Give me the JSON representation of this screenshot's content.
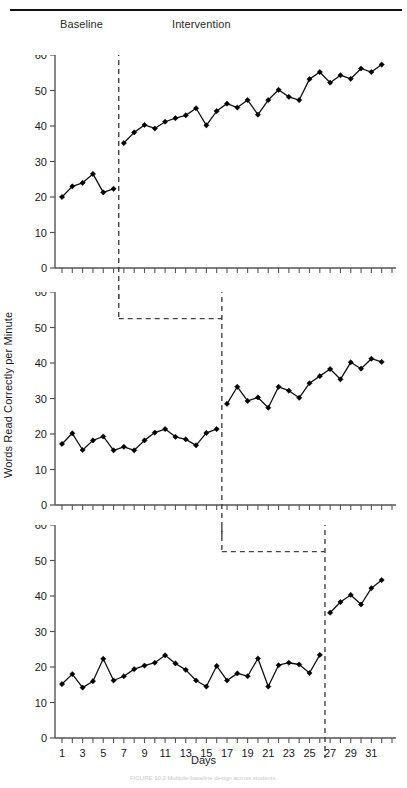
{
  "figure": {
    "top_rule": true,
    "x_axis_title": "Days",
    "y_axis_title": "Words Read Correctly per Minute",
    "caption": "FIGURE 10.2  Multiple-baseline design across students.",
    "phase_labels": {
      "baseline": "Baseline",
      "intervention": "Intervention"
    },
    "colors": {
      "line": "#111111",
      "marker": "#000000",
      "axis": "#555555",
      "phase_line": "#444444",
      "text": "#1a1a1a",
      "background": "#ffffff"
    }
  },
  "chart_data": {
    "type": "line",
    "title": "",
    "subtitle": "",
    "xlabel": "Days",
    "ylabel": "Words Read Correctly per Minute",
    "xlim": [
      0.3,
      33.7
    ],
    "ylim": [
      0,
      60
    ],
    "yticks": [
      0,
      10,
      20,
      30,
      40,
      50,
      60
    ],
    "xticks": [
      1,
      2,
      3,
      4,
      5,
      6,
      7,
      8,
      9,
      10,
      11,
      12,
      13,
      14,
      15,
      16,
      17,
      18,
      19,
      20,
      21,
      22,
      23,
      24,
      25,
      26,
      27,
      28,
      29,
      30,
      31,
      32,
      33
    ],
    "xticklabels": [
      "1",
      "",
      "3",
      "",
      "5",
      "",
      "7",
      "",
      "9",
      "",
      "11",
      "",
      "13",
      "",
      "15",
      "",
      "17",
      "",
      "19",
      "",
      "21",
      "",
      "23",
      "",
      "25",
      "",
      "27",
      "",
      "29",
      "",
      "31",
      "",
      ""
    ],
    "grid": false,
    "legend": null,
    "design": "multiple-baseline across participants",
    "panels": [
      {
        "name": "panel-1",
        "phase_change_day": 6.5,
        "phases": [
          {
            "label": "Baseline",
            "x": [
              1,
              2,
              3,
              4,
              5,
              6
            ],
            "y": [
              20.0,
              23.0,
              24.0,
              26.5,
              21.3,
              22.3
            ]
          },
          {
            "label": "Intervention",
            "x": [
              7,
              8,
              9,
              10,
              11,
              12,
              13,
              14,
              15,
              16,
              17,
              18,
              19,
              20,
              21,
              22,
              23,
              24,
              25,
              26,
              27,
              28,
              29,
              30,
              31,
              32,
              33
            ],
            "y": [
              35.2,
              38.2,
              40.3,
              39.3,
              41.2,
              42.2,
              43.0,
              45.0,
              40.2,
              44.2,
              46.3,
              45.2,
              47.3,
              43.2,
              47.3,
              50.2,
              48.2,
              47.3,
              53.2,
              55.2,
              52.2,
              54.3,
              53.3,
              56.2,
              55.2,
              57.3
            ]
          }
        ]
      },
      {
        "name": "panel-2",
        "phase_change_day": 16.5,
        "phases": [
          {
            "label": "Baseline",
            "x": [
              1,
              2,
              3,
              4,
              5,
              6,
              7,
              8,
              9,
              10,
              11,
              12,
              13,
              14,
              15,
              16
            ],
            "y": [
              17.2,
              20.2,
              15.5,
              18.2,
              19.3,
              15.4,
              16.4,
              15.4,
              18.2,
              20.4,
              21.4,
              19.2,
              18.5,
              16.8,
              20.3,
              21.4
            ]
          },
          {
            "label": "Intervention",
            "x": [
              17,
              18,
              19,
              20,
              21,
              22,
              23,
              24,
              25,
              26,
              27,
              28,
              29,
              30,
              31,
              32,
              33
            ],
            "y": [
              28.5,
              33.3,
              29.3,
              30.3,
              27.4,
              33.3,
              32.2,
              30.2,
              34.3,
              36.3,
              38.3,
              35.4,
              40.2,
              38.4,
              41.2,
              40.3
            ]
          }
        ]
      },
      {
        "name": "panel-3",
        "phase_change_day": 26.5,
        "phases": [
          {
            "label": "Baseline",
            "x": [
              1,
              2,
              3,
              4,
              5,
              6,
              7,
              8,
              9,
              10,
              11,
              12,
              13,
              14,
              15,
              16,
              17,
              18,
              19,
              20,
              21,
              22,
              23,
              24,
              25,
              26
            ],
            "y": [
              15.2,
              18.0,
              14.2,
              16.0,
              22.3,
              16.2,
              17.4,
              19.4,
              20.4,
              21.2,
              23.3,
              21.0,
              19.2,
              16.2,
              14.5,
              20.3,
              16.2,
              18.2,
              17.4,
              22.4,
              14.5,
              20.5,
              21.2,
              20.7,
              18.3,
              23.4,
              22.6
            ]
          },
          {
            "label": "Intervention",
            "x": [
              27,
              28,
              29,
              30,
              31,
              32,
              33
            ],
            "y": [
              35.3,
              38.3,
              40.3,
              37.6,
              42.2,
              44.5
            ]
          }
        ]
      }
    ]
  }
}
